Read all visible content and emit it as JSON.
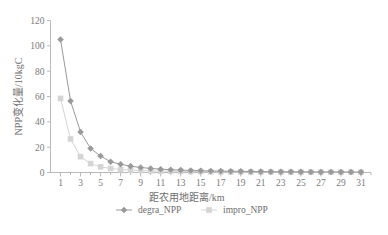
{
  "chart_data": {
    "type": "line",
    "title": "",
    "xlabel": "距农用地距离/km",
    "ylabel": "NPP变化量/10kgC",
    "xlim": [
      0,
      32
    ],
    "ylim": [
      0,
      120
    ],
    "ytick_labels": [
      "0",
      "20",
      "40",
      "60",
      "80",
      "100",
      "120"
    ],
    "ytick_values": [
      0,
      20,
      40,
      60,
      80,
      100,
      120
    ],
    "xtick_labels": [
      "1",
      "3",
      "5",
      "7",
      "9",
      "11",
      "13",
      "15",
      "17",
      "19",
      "21",
      "23",
      "25",
      "27",
      "29",
      "31"
    ],
    "xtick_values": [
      1,
      3,
      5,
      7,
      9,
      11,
      13,
      15,
      17,
      19,
      21,
      23,
      25,
      27,
      29,
      31
    ],
    "xtick_minor_values": [
      2,
      4,
      6,
      8,
      10,
      12,
      14,
      16,
      18,
      20,
      22,
      24,
      26,
      28,
      30,
      32
    ],
    "grid": false,
    "legend_position": "bottom",
    "x": [
      1,
      2,
      3,
      4,
      5,
      6,
      7,
      8,
      9,
      10,
      11,
      12,
      13,
      14,
      15,
      16,
      17,
      18,
      19,
      20,
      21,
      22,
      23,
      24,
      25,
      26,
      27,
      28,
      29,
      30,
      31
    ],
    "series": [
      {
        "name": "degra_NPP",
        "color": "#9a9a9a",
        "marker": "diamond",
        "values": [
          105,
          56.5,
          32,
          19,
          13,
          8.5,
          6.5,
          5,
          4,
          3.2,
          2.6,
          2.2,
          1.9,
          1.6,
          1.4,
          1.2,
          1.1,
          1.0,
          0.9,
          0.8,
          0.7,
          0.65,
          0.6,
          0.55,
          0.5,
          0.45,
          0.42,
          0.4,
          0.38,
          0.35,
          0.32
        ]
      },
      {
        "name": "impro_NPP",
        "color": "#d4d4d4",
        "marker": "square",
        "values": [
          58.5,
          26.5,
          12.5,
          7,
          4.5,
          3.2,
          2.4,
          1.9,
          1.6,
          1.3,
          1.1,
          1.0,
          0.9,
          0.8,
          0.7,
          0.6,
          0.55,
          0.5,
          0.46,
          0.42,
          0.4,
          0.37,
          0.34,
          0.32,
          0.3,
          0.28,
          0.26,
          0.25,
          0.23,
          0.22,
          0.2
        ]
      }
    ]
  },
  "legend": {
    "items": [
      {
        "label": "degra_NPP",
        "color": "#9a9a9a",
        "marker": "diamond"
      },
      {
        "label": "impro_NPP",
        "color": "#d4d4d4",
        "marker": "square"
      }
    ]
  },
  "axes": {
    "y_title": "NPP变化量/10kgC",
    "x_title": "距农用地距离/km"
  }
}
